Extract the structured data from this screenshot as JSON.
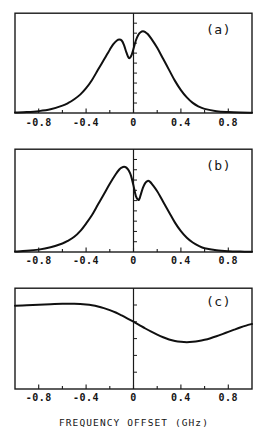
{
  "figure": {
    "xaxis_title": "FREQUENCY OFFSET  (GHz)",
    "tick_labels": [
      "-0.8",
      "-0.4",
      "0",
      "0.4",
      "0.8"
    ],
    "tick_values": [
      -0.8,
      -0.4,
      0,
      0.4,
      0.8
    ],
    "panel_labels": [
      "(a)",
      "(b)",
      "(c)"
    ],
    "colors": {
      "curve": "#101010",
      "frame": "#1a1a1a",
      "background": "#ffffff"
    }
  },
  "chart_data": [
    {
      "type": "line",
      "title": "(a)",
      "xlabel": "FREQUENCY OFFSET  (GHz)",
      "ylabel": "",
      "xlim": [
        -1.0,
        1.0
      ],
      "ylim": [
        0,
        1.0
      ],
      "grid": false,
      "legend": "none",
      "annotations": [
        "(a)"
      ],
      "xticks": [
        -0.8,
        -0.4,
        0,
        0.4,
        0.8
      ],
      "xticklabels": [
        "-0.8",
        "-0.4",
        "0",
        "0.4",
        "0.8"
      ],
      "x": [
        -1.0,
        -0.9,
        -0.8,
        -0.7,
        -0.6,
        -0.55,
        -0.5,
        -0.45,
        -0.4,
        -0.35,
        -0.3,
        -0.25,
        -0.2,
        -0.17,
        -0.14,
        -0.12,
        -0.1,
        -0.08,
        -0.06,
        -0.04,
        -0.02,
        0.0,
        0.02,
        0.04,
        0.06,
        0.08,
        0.1,
        0.12,
        0.15,
        0.2,
        0.25,
        0.3,
        0.35,
        0.4,
        0.45,
        0.5,
        0.55,
        0.6,
        0.7,
        0.8,
        0.9,
        1.0
      ],
      "y": [
        0.005,
        0.01,
        0.02,
        0.04,
        0.08,
        0.11,
        0.15,
        0.2,
        0.27,
        0.36,
        0.47,
        0.58,
        0.69,
        0.75,
        0.79,
        0.8,
        0.79,
        0.74,
        0.66,
        0.6,
        0.62,
        0.7,
        0.79,
        0.85,
        0.88,
        0.89,
        0.88,
        0.86,
        0.81,
        0.71,
        0.59,
        0.47,
        0.35,
        0.25,
        0.17,
        0.11,
        0.07,
        0.045,
        0.02,
        0.01,
        0.005,
        0.003
      ]
    },
    {
      "type": "line",
      "title": "(b)",
      "xlabel": "FREQUENCY OFFSET  (GHz)",
      "ylabel": "",
      "xlim": [
        -1.0,
        1.0
      ],
      "ylim": [
        0,
        1.0
      ],
      "grid": false,
      "legend": "none",
      "annotations": [
        "(b)"
      ],
      "xticks": [
        -0.8,
        -0.4,
        0,
        0.4,
        0.8
      ],
      "xticklabels": [
        "-0.8",
        "-0.4",
        "0",
        "0.4",
        "0.8"
      ],
      "x": [
        -1.0,
        -0.9,
        -0.8,
        -0.7,
        -0.6,
        -0.55,
        -0.5,
        -0.45,
        -0.4,
        -0.35,
        -0.3,
        -0.25,
        -0.2,
        -0.15,
        -0.12,
        -0.1,
        -0.08,
        -0.06,
        -0.04,
        -0.02,
        0.0,
        0.02,
        0.04,
        0.05,
        0.06,
        0.08,
        0.1,
        0.12,
        0.14,
        0.16,
        0.2,
        0.25,
        0.3,
        0.35,
        0.4,
        0.45,
        0.5,
        0.55,
        0.6,
        0.7,
        0.8,
        0.9,
        1.0
      ],
      "y": [
        0.005,
        0.012,
        0.025,
        0.05,
        0.09,
        0.12,
        0.16,
        0.22,
        0.3,
        0.39,
        0.5,
        0.61,
        0.72,
        0.82,
        0.87,
        0.89,
        0.9,
        0.89,
        0.86,
        0.8,
        0.7,
        0.59,
        0.55,
        0.56,
        0.6,
        0.68,
        0.73,
        0.75,
        0.74,
        0.71,
        0.64,
        0.53,
        0.42,
        0.31,
        0.22,
        0.15,
        0.1,
        0.065,
        0.04,
        0.018,
        0.008,
        0.004,
        0.002
      ]
    },
    {
      "type": "line",
      "title": "(c)",
      "xlabel": "FREQUENCY OFFSET  (GHz)",
      "ylabel": "",
      "xlim": [
        -1.0,
        1.0
      ],
      "ylim": [
        0,
        1.0
      ],
      "grid": false,
      "legend": "none",
      "annotations": [
        "(c)"
      ],
      "xticks": [
        -0.8,
        -0.4,
        0,
        0.4,
        0.8
      ],
      "xticklabels": [
        "-0.8",
        "-0.4",
        "0",
        "0.4",
        "0.8"
      ],
      "x": [
        -1.0,
        -0.9,
        -0.8,
        -0.7,
        -0.6,
        -0.5,
        -0.45,
        -0.4,
        -0.35,
        -0.3,
        -0.25,
        -0.2,
        -0.15,
        -0.1,
        -0.05,
        0.0,
        0.05,
        0.1,
        0.15,
        0.2,
        0.25,
        0.3,
        0.35,
        0.4,
        0.45,
        0.5,
        0.55,
        0.6,
        0.65,
        0.7,
        0.75,
        0.8,
        0.85,
        0.9,
        0.95,
        1.0
      ],
      "y": [
        0.86,
        0.865,
        0.87,
        0.875,
        0.88,
        0.88,
        0.878,
        0.873,
        0.865,
        0.853,
        0.836,
        0.815,
        0.79,
        0.76,
        0.728,
        0.695,
        0.66,
        0.625,
        0.592,
        0.562,
        0.535,
        0.512,
        0.496,
        0.487,
        0.484,
        0.487,
        0.495,
        0.508,
        0.525,
        0.545,
        0.567,
        0.59,
        0.613,
        0.635,
        0.655,
        0.672
      ]
    }
  ]
}
